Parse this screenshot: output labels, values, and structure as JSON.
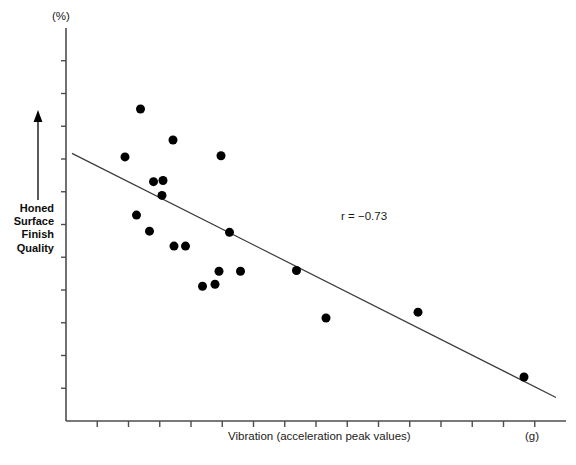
{
  "chart_data": {
    "type": "scatter",
    "title": "",
    "xlabel": "Vibration (acceleration peak values)",
    "ylabel": "Honed Surface Finish Quality",
    "x_unit": "(g)",
    "y_unit": "(%)",
    "annotation": "r = −0.73",
    "correlation": -0.73,
    "grid": false,
    "legend": null,
    "axis_direction_arrow": "up",
    "xlim": [
      0,
      100
    ],
    "ylim": [
      0,
      100
    ],
    "x_tick_count": 15,
    "y_tick_count": 11,
    "x_tick_labels": [],
    "y_tick_labels": [],
    "points": [
      {
        "x": 14.9,
        "y": 79.4
      },
      {
        "x": 21.4,
        "y": 71.5
      },
      {
        "x": 11.8,
        "y": 67.2
      },
      {
        "x": 31.0,
        "y": 67.5
      },
      {
        "x": 17.5,
        "y": 60.9
      },
      {
        "x": 19.4,
        "y": 61.2
      },
      {
        "x": 19.2,
        "y": 57.4
      },
      {
        "x": 14.1,
        "y": 52.4
      },
      {
        "x": 16.7,
        "y": 48.3
      },
      {
        "x": 21.6,
        "y": 44.5
      },
      {
        "x": 23.9,
        "y": 44.5
      },
      {
        "x": 32.7,
        "y": 48.0
      },
      {
        "x": 30.6,
        "y": 38.1
      },
      {
        "x": 34.9,
        "y": 38.1
      },
      {
        "x": 27.3,
        "y": 34.3
      },
      {
        "x": 29.8,
        "y": 34.8
      },
      {
        "x": 46.1,
        "y": 38.3
      },
      {
        "x": 52.0,
        "y": 26.2
      },
      {
        "x": 70.4,
        "y": 27.7
      },
      {
        "x": 91.6,
        "y": 11.2
      }
    ],
    "trend_line": {
      "type": "linear-fit",
      "x_start": 1.2,
      "y_start": 68.1,
      "x_end": 98.0,
      "y_end": 6.0
    },
    "marker": {
      "shape": "circle",
      "color": "#000000",
      "size": 9
    },
    "axis_color": "#4d4d4d",
    "line_color": "#3a3a3a"
  },
  "labels": {
    "y_unit": "(%)",
    "x_unit": "(g)",
    "x_title": "Vibration (acceleration peak values)",
    "y_title_lines": [
      "Honed",
      "Surface",
      "Finish",
      "Quality"
    ],
    "annotation": "r = −0.73"
  }
}
